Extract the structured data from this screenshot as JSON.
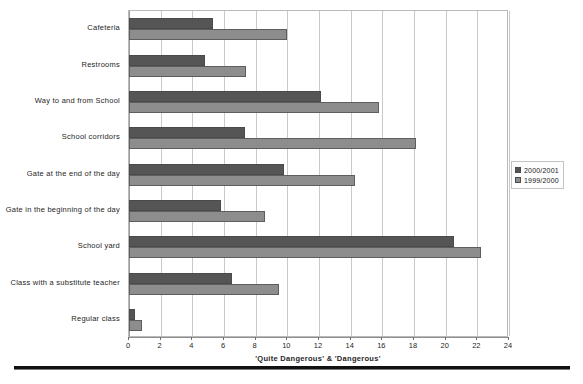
{
  "chart_data": {
    "type": "bar",
    "orientation": "horizontal",
    "title": "",
    "xlabel": "'Quite Dangerous' & 'Dangerous'",
    "ylabel": "",
    "xlim": [
      0,
      24
    ],
    "xticks": [
      0,
      2,
      4,
      6,
      8,
      10,
      12,
      14,
      16,
      18,
      20,
      22,
      24
    ],
    "grid": "vertical",
    "legend_position": "right",
    "categories": [
      "Cafeteria",
      "Restrooms",
      "Way to and from School",
      "School corridors",
      "Gate at the end of the day",
      "Gate in the beginning of the day",
      "School yard",
      "Class with a substitute teacher",
      "Regular class"
    ],
    "series": [
      {
        "name": "2000/2001",
        "color": "#555555",
        "values": [
          5.3,
          4.8,
          12.1,
          7.3,
          9.8,
          5.8,
          20.5,
          6.5,
          0.4
        ]
      },
      {
        "name": "1999/2000",
        "color": "#8d8d8d",
        "values": [
          10.0,
          7.4,
          15.8,
          18.1,
          14.3,
          8.6,
          22.2,
          9.5,
          0.8
        ]
      }
    ]
  },
  "legend": {
    "entries": [
      {
        "label": "2000/2001",
        "swatch": "#555555"
      },
      {
        "label": "1999/2000",
        "swatch": "#8d8d8d"
      }
    ]
  },
  "axis": {
    "x_title": "'Quite Dangerous' & 'Dangerous'"
  }
}
